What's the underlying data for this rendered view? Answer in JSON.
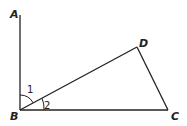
{
  "diagram": {
    "type": "geometry",
    "points": {
      "A": {
        "label": "A",
        "x": 20,
        "y": 15
      },
      "B": {
        "label": "B",
        "x": 20,
        "y": 110
      },
      "C": {
        "label": "C",
        "x": 168,
        "y": 110
      },
      "D": {
        "label": "D",
        "x": 137,
        "y": 47
      }
    },
    "segments": [
      "AB",
      "BD",
      "BC",
      "DC"
    ],
    "angles": [
      {
        "label": "1",
        "vertex": "B",
        "between": [
          "BA",
          "BD"
        ]
      },
      {
        "label": "2",
        "vertex": "B",
        "between": [
          "BD",
          "BC"
        ]
      }
    ],
    "stroke_color": "#222222"
  }
}
